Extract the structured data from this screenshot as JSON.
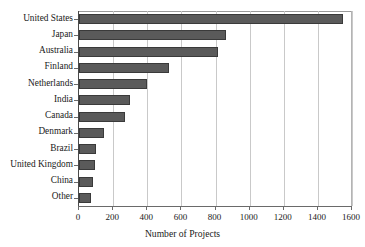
{
  "chart_data": {
    "type": "bar",
    "orientation": "horizontal",
    "title": "",
    "title_clipped_text": "",
    "xlabel": "Number of Projects",
    "ylabel": "",
    "categories": [
      "United States",
      "Japan",
      "Australia",
      "Finland",
      "Netherlands",
      "India",
      "Canada",
      "Denmark",
      "Brazil",
      "United Kingdom",
      "China",
      "Other"
    ],
    "values": [
      1550,
      860,
      815,
      525,
      400,
      300,
      270,
      145,
      100,
      95,
      80,
      70
    ],
    "xlim": [
      0,
      1600
    ],
    "xticks": [
      0,
      200,
      400,
      600,
      800,
      1000,
      1200,
      1400,
      1600
    ],
    "xtick_labels": [
      "0",
      "200",
      "400",
      "600",
      "800",
      "1000",
      "1200",
      "1400",
      "1600"
    ],
    "grid": "vertical",
    "legend": "none",
    "bar_color": "#5a5a5a",
    "bar_edge_color": "#3a3a3a",
    "gridline_color": "#c9c9c9",
    "axis_color": "#6a6a6a",
    "background_color": "#ffffff"
  }
}
